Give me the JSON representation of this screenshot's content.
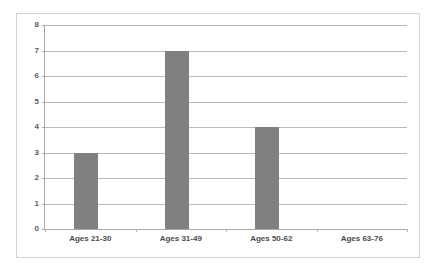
{
  "chart_data": {
    "type": "bar",
    "title": "",
    "subtitle": "",
    "xlabel": "",
    "ylabel": "",
    "categories": [
      "Ages 21-30",
      "Ages 31-49",
      "Ages 50-62",
      "Ages 63-76"
    ],
    "values": [
      3,
      7,
      4,
      0
    ],
    "ylim": [
      0,
      8
    ],
    "ytick_labels": [
      "0",
      "1",
      "2",
      "3",
      "4",
      "5",
      "6",
      "7",
      "8"
    ],
    "ytick_values": [
      0,
      1,
      2,
      3,
      4,
      5,
      6,
      7,
      8
    ],
    "grid": true,
    "grid_axis": "y",
    "legend": false,
    "legend_position": "none",
    "annotations": [],
    "series": [
      {
        "name": "",
        "values": [
          3,
          7,
          4,
          0
        ],
        "color": "#808080"
      }
    ],
    "colors": {
      "bar_fill": "#808080",
      "gridline": "#b9b9b9",
      "axis_line": "#a8a8a8",
      "frame_border": "#d2d2d2",
      "tick_label": "#5d5d5d",
      "category_label": "#4c4c4c",
      "background": "#ffffff"
    }
  }
}
